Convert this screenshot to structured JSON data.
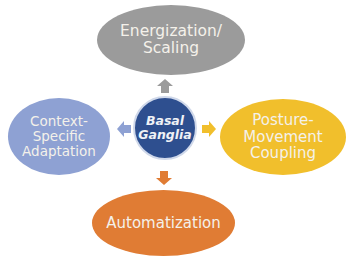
{
  "diagram": {
    "center": {
      "label": "Basal\nGanglia",
      "color": "#2e4f8f"
    },
    "nodes": [
      {
        "id": "top",
        "label": "Energization/\nScaling",
        "color": "#9b9b9b",
        "arrow_color": "#9b9b9b"
      },
      {
        "id": "right",
        "label": "Posture-\nMovement\nCoupling",
        "color": "#f1bf2c",
        "arrow_color": "#f1bf2c"
      },
      {
        "id": "bottom",
        "label": "Automatization",
        "color": "#e07c34",
        "arrow_color": "#e07c34"
      },
      {
        "id": "left",
        "label": "Context-\nSpecific\nAdaptation",
        "color": "#8ea1d3",
        "arrow_color": "#8ea1d3"
      }
    ]
  }
}
